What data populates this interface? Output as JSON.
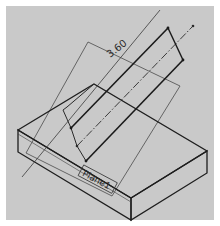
{
  "figure": {
    "dimension_label": "3.60",
    "plane_label": "Plane1"
  },
  "colors": {
    "background": "#c9c9c9",
    "border": "#ffffff",
    "line_dark": "#1e1e1e",
    "line_medium": "#3a3a3a",
    "line_light": "#555555"
  }
}
